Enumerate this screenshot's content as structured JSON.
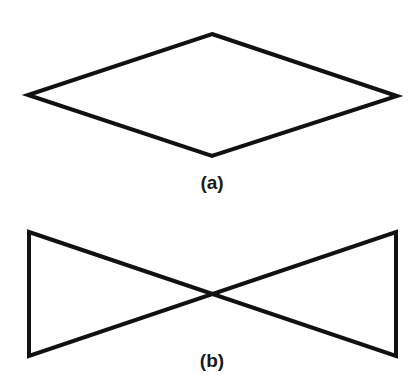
{
  "figures": [
    {
      "label": "(a)",
      "shape": "rhombus",
      "points": [
        [
          212,
          34
        ],
        [
          397,
          96
        ],
        [
          212,
          156
        ],
        [
          28,
          95
        ]
      ]
    },
    {
      "label": "(b)",
      "shape": "bowtie",
      "points": [
        [
          29,
          232
        ],
        [
          396,
          356
        ],
        [
          396,
          232
        ],
        [
          29,
          356
        ]
      ]
    }
  ],
  "colors": {
    "stroke": "#111111",
    "background": "#ffffff"
  }
}
